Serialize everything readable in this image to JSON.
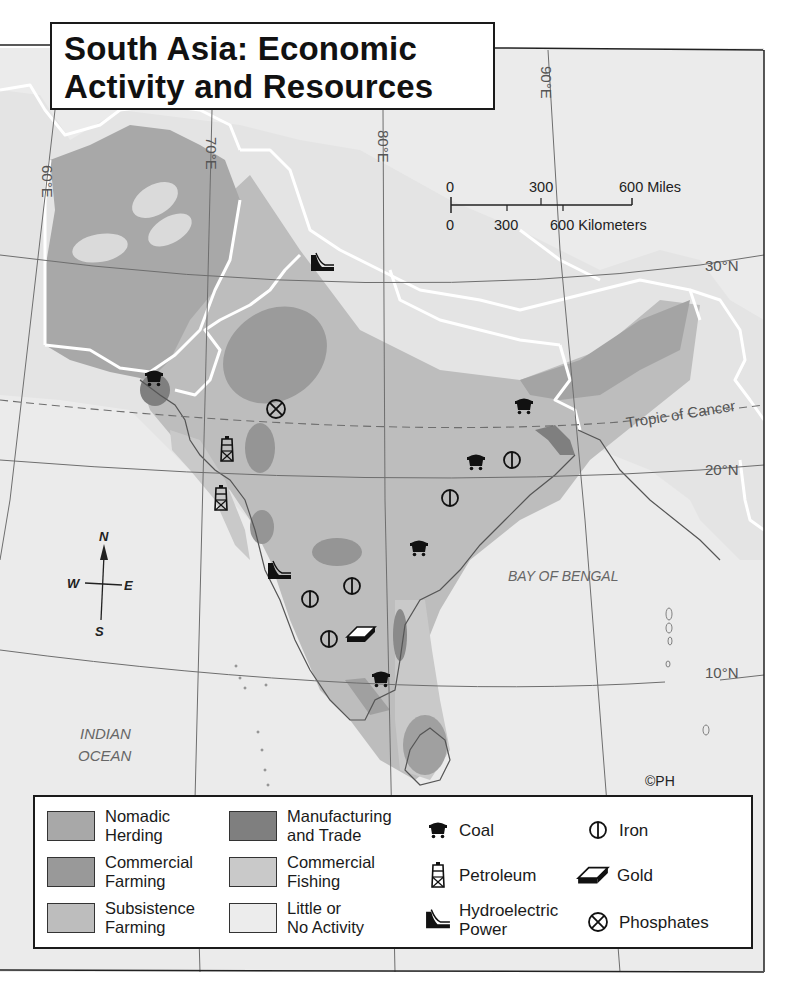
{
  "title": {
    "line1": "South Asia: Economic",
    "line2": "Activity and Resources"
  },
  "scale_bar": {
    "miles_labels": [
      "0",
      "300",
      "600 Miles"
    ],
    "km_labels": [
      "0",
      "300",
      "600 Kilometers"
    ]
  },
  "graticule": {
    "meridians": [
      "60°E",
      "70°E",
      "80°E",
      "90°E"
    ],
    "parallels": [
      "30°N",
      "20°N",
      "10°N"
    ],
    "tropic": "Tropic of Cancer"
  },
  "compass": {
    "n": "N",
    "s": "S",
    "e": "E",
    "w": "W"
  },
  "water_labels": {
    "bay": "BAY OF BENGAL",
    "ocean_line1": "INDIAN",
    "ocean_line2": "OCEAN"
  },
  "copyright": "©PH",
  "colors": {
    "nomadic_herding": "#a8a8a8",
    "commercial_farming": "#999999",
    "subsistence_farming": "#bdbdbd",
    "manufacturing_trade": "#7f7f7f",
    "commercial_fishing": "#c9c9c9",
    "little_or_no_activity": "#e4e4e4",
    "water": "#ededed",
    "border": "#ffffff"
  },
  "legend": {
    "land_use": [
      {
        "label": "Nomadic\nHerding",
        "color": "#a8a8a8"
      },
      {
        "label": "Commercial\nFarming",
        "color": "#999999"
      },
      {
        "label": "Subsistence\nFarming",
        "color": "#bdbdbd"
      },
      {
        "label": "Manufacturing\nand Trade",
        "color": "#7f7f7f"
      },
      {
        "label": "Commercial\nFishing",
        "color": "#c9c9c9"
      },
      {
        "label": "Little or\nNo Activity",
        "color": "#e4e4e4"
      }
    ],
    "resources": [
      {
        "label": "Coal",
        "icon": "coal-cart-icon"
      },
      {
        "label": "Petroleum",
        "icon": "oil-derrick-icon"
      },
      {
        "label": "Hydroelectric\nPower",
        "icon": "dam-icon"
      },
      {
        "label": "Iron",
        "icon": "iron-circle-icon"
      },
      {
        "label": "Gold",
        "icon": "gold-bar-icon"
      },
      {
        "label": "Phosphates",
        "icon": "circled-x-icon"
      }
    ]
  }
}
